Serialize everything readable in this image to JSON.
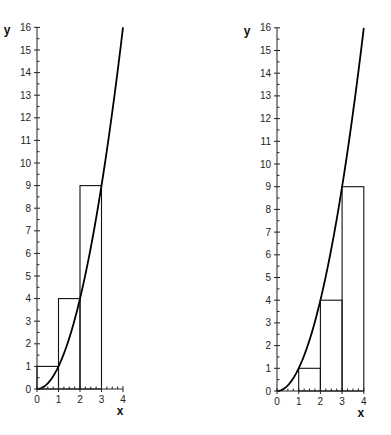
{
  "chart_data": [
    {
      "type": "line",
      "title": "",
      "description": "Upper (right-endpoint) Riemann sum rectangles for y = x^2 on [0,3]",
      "function": "y = x^2",
      "xlabel": "x",
      "ylabel": "y",
      "xlim": [
        0,
        4
      ],
      "ylim": [
        0,
        16
      ],
      "x_ticks": [
        "0",
        "1",
        "2",
        "3",
        "4"
      ],
      "y_ticks": [
        "0",
        "1",
        "2",
        "3",
        "4",
        "5",
        "6",
        "7",
        "8",
        "9",
        "10",
        "11",
        "12",
        "13",
        "14",
        "15",
        "16"
      ],
      "grid": false,
      "curve": {
        "x": [
          0,
          0.5,
          1,
          1.5,
          2,
          2.5,
          3,
          3.5,
          4
        ],
        "y": [
          0,
          0.25,
          1,
          2.25,
          4,
          6.25,
          9,
          12.25,
          16
        ]
      },
      "rectangles": [
        {
          "x0": 0,
          "x1": 1,
          "height": 1
        },
        {
          "x0": 1,
          "x1": 2,
          "height": 4
        },
        {
          "x0": 2,
          "x1": 3,
          "height": 9
        }
      ]
    },
    {
      "type": "line",
      "title": "",
      "description": "Lower (left-endpoint) Riemann sum rectangles for y = x^2 on [0,4]",
      "function": "y = x^2",
      "xlabel": "x",
      "ylabel": "y",
      "xlim": [
        0,
        4
      ],
      "ylim": [
        0,
        16
      ],
      "x_ticks": [
        "0",
        "1",
        "2",
        "3",
        "4"
      ],
      "y_ticks": [
        "0",
        "1",
        "2",
        "3",
        "4",
        "5",
        "6",
        "7",
        "8",
        "9",
        "10",
        "11",
        "12",
        "13",
        "14",
        "15",
        "16"
      ],
      "grid": false,
      "curve": {
        "x": [
          0,
          0.5,
          1,
          1.5,
          2,
          2.5,
          3,
          3.5,
          4
        ],
        "y": [
          0,
          0.25,
          1,
          2.25,
          4,
          6.25,
          9,
          12.25,
          16
        ]
      },
      "rectangles": [
        {
          "x0": 0,
          "x1": 1,
          "height": 0
        },
        {
          "x0": 1,
          "x1": 2,
          "height": 1
        },
        {
          "x0": 2,
          "x1": 3,
          "height": 4
        },
        {
          "x0": 3,
          "x1": 4,
          "height": 9
        }
      ]
    }
  ]
}
